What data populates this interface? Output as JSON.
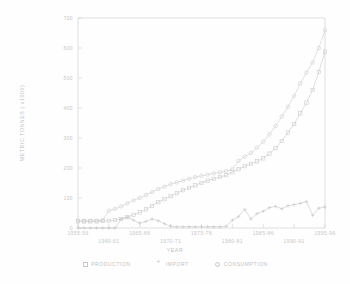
{
  "chart_data": {
    "type": "line",
    "title": "",
    "xlabel": "YEAR",
    "ylabel": "METRIC TONNES ( x1000)",
    "ylim": [
      0,
      700
    ],
    "yticks": [
      0,
      100,
      200,
      300,
      400,
      500,
      600,
      700
    ],
    "ytick_labels": [
      "0",
      "100",
      "200",
      "300",
      "400",
      "500",
      "600",
      "700"
    ],
    "grid": false,
    "legend_position": "below",
    "x": [
      "1955-56",
      "1956-57",
      "1957-58",
      "1958-59",
      "1959-60",
      "1960-61",
      "1961-62",
      "1962-63",
      "1963-64",
      "1964-65",
      "1965-66",
      "1966-67",
      "1967-68",
      "1968-69",
      "1969-70",
      "1970-71",
      "1971-72",
      "1972-73",
      "1973-74",
      "1974-75",
      "1975-76",
      "1976-77",
      "1977-78",
      "1978-79",
      "1979-80",
      "1980-81",
      "1981-82",
      "1982-83",
      "1983-84",
      "1984-85",
      "1985-86",
      "1986-87",
      "1987-88",
      "1988-89",
      "1989-90",
      "1990-91",
      "1991-92",
      "1992-93",
      "1993-94",
      "1994-95",
      "1995-96"
    ],
    "xtick_labels": [
      "1955-56",
      "1960-61",
      "1965-66",
      "1970-71",
      "1975-76",
      "1980-81",
      "1985-86",
      "1990-91",
      "1995-96"
    ],
    "series": [
      {
        "name": "PRODUCTION",
        "marker": "square",
        "values": [
          22,
          22,
          22,
          22,
          23,
          24,
          26,
          30,
          36,
          44,
          52,
          62,
          74,
          86,
          96,
          106,
          116,
          126,
          134,
          142,
          150,
          158,
          164,
          170,
          176,
          186,
          196,
          206,
          214,
          222,
          232,
          248,
          266,
          290,
          318,
          346,
          382,
          418,
          460,
          520,
          588
        ]
      },
      {
        "name": "IMPORT",
        "marker": "plus",
        "values": [
          0,
          0,
          0,
          0,
          0,
          0,
          0,
          30,
          36,
          26,
          16,
          22,
          30,
          24,
          14,
          6,
          4,
          4,
          4,
          4,
          4,
          4,
          4,
          4,
          6,
          26,
          38,
          62,
          30,
          48,
          56,
          68,
          72,
          64,
          74,
          78,
          82,
          88,
          42,
          66,
          70
        ]
      },
      {
        "name": "CONSUMPTION",
        "marker": "circle",
        "values": [
          24,
          24,
          24,
          24,
          26,
          58,
          64,
          72,
          82,
          92,
          100,
          110,
          120,
          130,
          138,
          146,
          152,
          158,
          164,
          170,
          174,
          178,
          182,
          186,
          190,
          196,
          224,
          238,
          250,
          268,
          288,
          312,
          340,
          372,
          404,
          440,
          482,
          518,
          552,
          600,
          660
        ]
      }
    ]
  },
  "legend": {
    "entries": [
      {
        "label": "PRODUCTION",
        "marker": "square"
      },
      {
        "label": "IMPORT",
        "marker": "plus"
      },
      {
        "label": "CONSUMPTION",
        "marker": "circle"
      }
    ]
  },
  "colors": {
    "production": "#c9c9c9",
    "import": "#c4c4c4",
    "consumption": "#cccccc",
    "axis": "#d2d2d2",
    "text": "#c2c2c2",
    "background": "#fefefe"
  }
}
